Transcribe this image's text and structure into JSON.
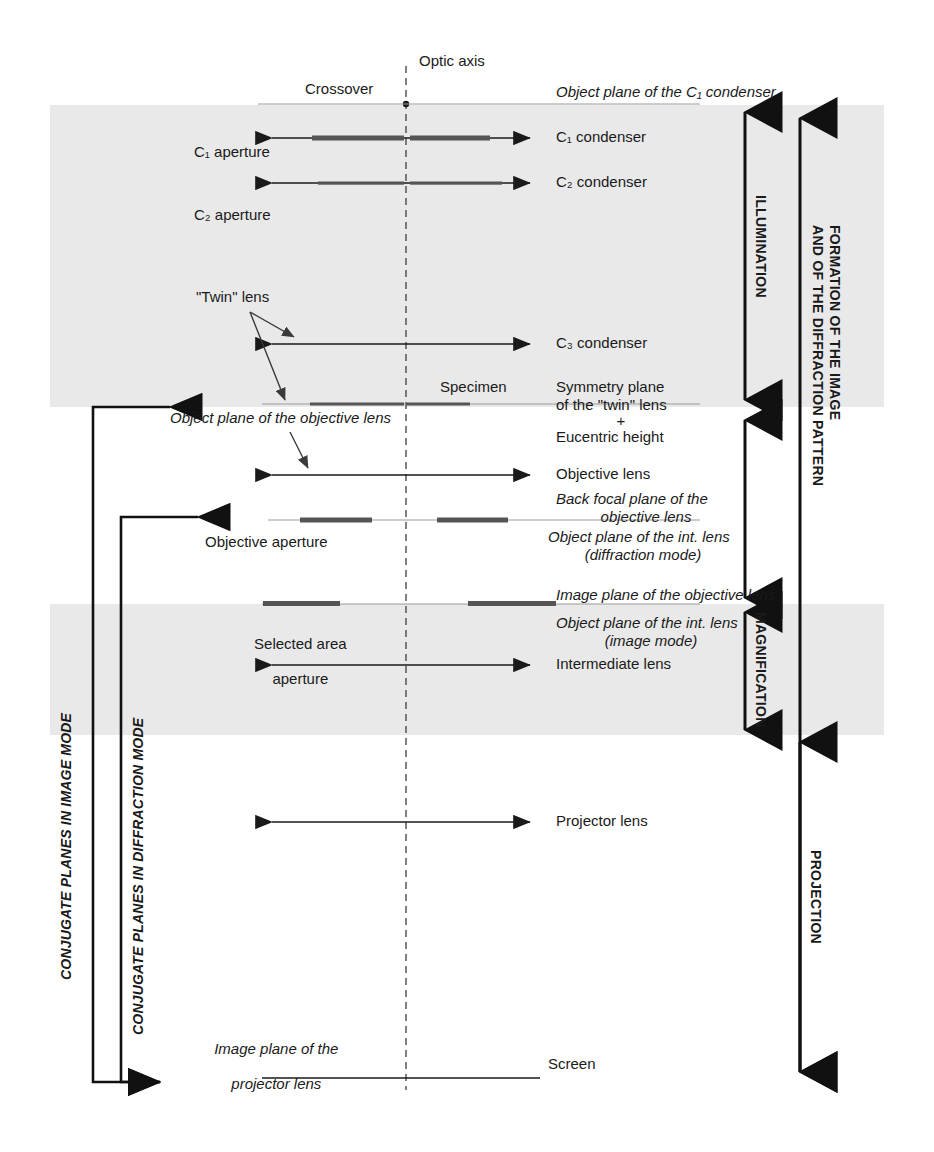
{
  "figure": {
    "optic_axis_label": "Optic axis",
    "crossover_label": "Crossover"
  },
  "colors": {
    "ink": "#1a1a1a",
    "band": "#e9e9e9",
    "faint_line": "#8a8a8a",
    "aperture_bar": "#555555",
    "page": "#ffffff"
  },
  "left_labels": [
    {
      "key": "c1_aperture",
      "text": "C₁ aperture"
    },
    {
      "key": "c2_aperture",
      "text": "C₂ aperture"
    },
    {
      "key": "twin_lens",
      "text": "\"Twin\" lens"
    },
    {
      "key": "obj_plane_objective",
      "text": "Object plane of the objective lens",
      "italic": true
    },
    {
      "key": "objective_aperture",
      "text": "Objective aperture"
    },
    {
      "key": "selected_area_aperture_1",
      "text": "Selected area"
    },
    {
      "key": "selected_area_aperture_2",
      "text": "aperture"
    },
    {
      "key": "image_plane_projector_1",
      "text": "Image plane of the",
      "italic": true
    },
    {
      "key": "image_plane_projector_2",
      "text": "projector lens",
      "italic": true
    }
  ],
  "right_labels": [
    {
      "key": "obj_plane_c1",
      "text": "Object plane of the C₁ condenser",
      "italic": true
    },
    {
      "key": "c1_condenser",
      "text": "C₁ condenser"
    },
    {
      "key": "c2_condenser",
      "text": "C₂ condenser"
    },
    {
      "key": "c3_condenser",
      "text": "C₃ condenser"
    },
    {
      "key": "symmetry_1",
      "text": "Symmetry plane"
    },
    {
      "key": "symmetry_2",
      "text": "of the \"twin\" lens"
    },
    {
      "key": "symmetry_plus",
      "text": "+"
    },
    {
      "key": "symmetry_3",
      "text": "Eucentric height"
    },
    {
      "key": "objective_lens",
      "text": "Objective lens"
    },
    {
      "key": "bfp_1",
      "text": "Back focal plane of the",
      "italic": true
    },
    {
      "key": "bfp_2",
      "text": "objective lens",
      "italic": true
    },
    {
      "key": "objplane_int_diff_1",
      "text": "Object plane of the int. lens",
      "italic": true
    },
    {
      "key": "objplane_int_diff_2",
      "text": "(diffraction mode)",
      "italic": true
    },
    {
      "key": "image_plane_objective",
      "text": "Image plane of the objective lens",
      "italic": true
    },
    {
      "key": "objplane_int_img_1",
      "text": "Object plane of the int. lens",
      "italic": true
    },
    {
      "key": "objplane_int_img_2",
      "text": "(image mode)",
      "italic": true
    },
    {
      "key": "intermediate_lens",
      "text": "Intermediate lens"
    },
    {
      "key": "projector_lens",
      "text": "Projector lens"
    },
    {
      "key": "screen",
      "text": "Screen"
    },
    {
      "key": "specimen",
      "text": "Specimen"
    }
  ],
  "vertical_right_brackets": [
    {
      "key": "illumination",
      "text": "ILLUMINATION"
    },
    {
      "key": "formation",
      "text": "FORMATION OF THE IMAGE\nAND OF THE DIFFRACTION PATTERN"
    },
    {
      "key": "magnification",
      "text": "MAGNIFICATION"
    },
    {
      "key": "projection",
      "text": "PROJECTION"
    }
  ],
  "vertical_left_brackets": [
    {
      "key": "conjugate_image",
      "text": "CONJUGATE PLANES IN IMAGE MODE"
    },
    {
      "key": "conjugate_diffraction",
      "text": "CONJUGATE PLANES IN DIFFRACTION MODE"
    }
  ],
  "lens_rows": [
    {
      "key": "c1_condenser",
      "y": 138,
      "x1": 262,
      "x2": 540,
      "label": "C₁ condenser"
    },
    {
      "key": "c2_condenser",
      "y": 183,
      "x1": 262,
      "x2": 540,
      "label": "C₂ condenser"
    },
    {
      "key": "c3_condenser",
      "y": 344,
      "x1": 262,
      "x2": 540,
      "label": "C₃ condenser"
    },
    {
      "key": "objective_lens",
      "y": 475,
      "x1": 262,
      "x2": 540,
      "label": "Objective lens"
    },
    {
      "key": "intermediate_lens",
      "y": 665,
      "x1": 262,
      "x2": 540,
      "label": "Intermediate lens"
    },
    {
      "key": "projector_lens",
      "y": 822,
      "x1": 262,
      "x2": 540,
      "label": "Projector lens"
    }
  ],
  "plane_rows": [
    {
      "key": "object_plane_c1",
      "y": 104,
      "x1": 258,
      "x2": 700
    },
    {
      "key": "specimen_plane",
      "y": 404,
      "x1": 262,
      "x2": 700
    },
    {
      "key": "back_focal_plane",
      "y": 520,
      "x1": 268,
      "x2": 700
    },
    {
      "key": "image_plane_objective",
      "y": 604,
      "x1": 262,
      "x2": 700
    },
    {
      "key": "screen_plane",
      "y": 1078,
      "x1": 262,
      "x2": 540
    }
  ],
  "aperture_bars": [
    {
      "key": "c1_aperture_left",
      "y": 138,
      "x1": 312,
      "x2": 404,
      "h": 5
    },
    {
      "key": "c1_aperture_right",
      "y": 138,
      "x1": 410,
      "x2": 490,
      "h": 5
    },
    {
      "key": "c2_aperture_left",
      "y": 183,
      "x1": 318,
      "x2": 404,
      "h": 3
    },
    {
      "key": "c2_aperture_right",
      "y": 183,
      "x1": 410,
      "x2": 502,
      "h": 3
    },
    {
      "key": "specimen_left",
      "y": 404,
      "x1": 310,
      "x2": 404,
      "h": 3
    },
    {
      "key": "specimen_right",
      "y": 404,
      "x1": 406,
      "x2": 470,
      "h": 3
    },
    {
      "key": "objective_aperture_left",
      "y": 520,
      "x1": 300,
      "x2": 372,
      "h": 5
    },
    {
      "key": "objective_aperture_right",
      "y": 520,
      "x1": 437,
      "x2": 508,
      "h": 5
    },
    {
      "key": "selected_area_left",
      "y": 604,
      "x1": 263,
      "x2": 340,
      "h": 5
    },
    {
      "key": "selected_area_right",
      "y": 604,
      "x1": 468,
      "x2": 556,
      "h": 5
    }
  ],
  "optic_axis": {
    "x": 406,
    "y_top": 66,
    "y_bottom": 1090
  },
  "shaded_bands": [
    {
      "key": "illumination_band",
      "y": 105,
      "height": 302
    },
    {
      "key": "magnification_band",
      "y": 604,
      "height": 131
    }
  ]
}
